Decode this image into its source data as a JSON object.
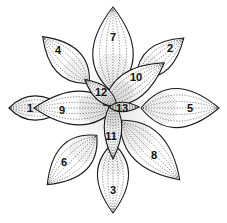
{
  "figure": {
    "background": "#ffffff",
    "ink": "#1a1a1a"
  },
  "leaves": [
    {
      "n": "1",
      "cx": 38,
      "cy": 108,
      "len": 58,
      "wid": 36,
      "rot": 0,
      "lx": 30,
      "ly": 108
    },
    {
      "n": "2",
      "cx": 160,
      "cy": 58,
      "len": 62,
      "wid": 40,
      "rot": -40,
      "lx": 170,
      "ly": 48
    },
    {
      "n": "3",
      "cx": 113,
      "cy": 178,
      "len": 70,
      "wid": 46,
      "rot": 90,
      "lx": 113,
      "ly": 190
    },
    {
      "n": "4",
      "cx": 66,
      "cy": 60,
      "len": 66,
      "wid": 44,
      "rot": -135,
      "lx": 58,
      "ly": 50
    },
    {
      "n": "5",
      "cx": 180,
      "cy": 108,
      "len": 78,
      "wid": 58,
      "rot": 0,
      "lx": 190,
      "ly": 108
    },
    {
      "n": "6",
      "cx": 72,
      "cy": 160,
      "len": 70,
      "wid": 50,
      "rot": 135,
      "lx": 64,
      "ly": 162
    },
    {
      "n": "7",
      "cx": 113,
      "cy": 50,
      "len": 86,
      "wid": 60,
      "rot": -90,
      "lx": 113,
      "ly": 37
    },
    {
      "n": "8",
      "cx": 150,
      "cy": 150,
      "len": 84,
      "wid": 52,
      "rot": 45,
      "lx": 154,
      "ly": 155
    },
    {
      "n": "9",
      "cx": 75,
      "cy": 108,
      "len": 82,
      "wid": 50,
      "rot": 180,
      "lx": 62,
      "ly": 110
    },
    {
      "n": "10",
      "cx": 134,
      "cy": 84,
      "len": 74,
      "wid": 42,
      "rot": -35,
      "lx": 136,
      "ly": 77
    },
    {
      "n": "11",
      "cx": 113,
      "cy": 130,
      "len": 58,
      "wid": 26,
      "rot": 90,
      "lx": 111,
      "ly": 136
    },
    {
      "n": "12",
      "cx": 101,
      "cy": 93,
      "len": 42,
      "wid": 22,
      "rot": -140,
      "lx": 101,
      "ly": 92
    },
    {
      "n": "13",
      "cx": 124,
      "cy": 107,
      "len": 30,
      "wid": 14,
      "rot": 0,
      "lx": 122,
      "ly": 108
    }
  ],
  "draw_order": [
    "4",
    "2",
    "7",
    "1",
    "5",
    "3",
    "6",
    "8",
    "9",
    "10",
    "11",
    "12",
    "13"
  ]
}
